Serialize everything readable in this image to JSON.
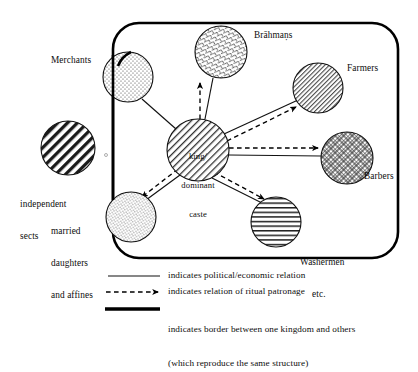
{
  "figure": {
    "title_visible": false,
    "colors": {
      "ink": "#111111",
      "background": "#ffffff",
      "border": "#000000"
    }
  },
  "nodes": [
    {
      "id": "independent-sects",
      "label": "independent\nsects",
      "label_line1": "independent",
      "label_line2": "sects",
      "pattern": "bold-diagonal-hatch",
      "inside_kingdom": false,
      "cx": 68,
      "cy": 148,
      "r": 27
    },
    {
      "id": "merchants",
      "label": "Merchants",
      "pattern": "stipple-dots",
      "inside_kingdom": "straddles-border",
      "cx": 128,
      "cy": 77,
      "r": 25
    },
    {
      "id": "brahmans",
      "label": "Brāhmaṇs",
      "pattern": "fine-crosshatch-zigzag",
      "inside_kingdom": true,
      "cx": 221,
      "cy": 52,
      "r": 26
    },
    {
      "id": "farmers",
      "label": "Farmers",
      "pattern": "fine-diagonal-hatch",
      "inside_kingdom": true,
      "cx": 318,
      "cy": 88,
      "r": 25
    },
    {
      "id": "king-dominant-caste",
      "label": "king/\ndominant\ncaste",
      "label_line1": "king/",
      "label_line2": "dominant",
      "label_line3": "caste",
      "pattern": "diagonal-hatch",
      "inside_kingdom": true,
      "cx": 198,
      "cy": 150,
      "r": 31
    },
    {
      "id": "barbers",
      "label": "Barbers",
      "pattern": "diagonal-crosshatch",
      "inside_kingdom": true,
      "cx": 347,
      "cy": 158,
      "r": 26
    },
    {
      "id": "married-daughters-and-affines",
      "label": "married\ndaughters\nand affines",
      "label_line1": "married",
      "label_line2": "daughters",
      "label_line3": "and affines",
      "pattern": "fine-stipple",
      "inside_kingdom": "straddles-border",
      "cx": 131,
      "cy": 217,
      "r": 25
    },
    {
      "id": "washermen-etc",
      "label": "Washermen\netc.",
      "label_line1": "Washermen",
      "label_line2": "etc.",
      "pattern": "horizontal-lines",
      "inside_kingdom": true,
      "cx": 276,
      "cy": 222,
      "r": 25
    }
  ],
  "edges": [
    {
      "from": "king-dominant-caste",
      "to": "merchants",
      "kinds": [
        "political-economic"
      ]
    },
    {
      "from": "king-dominant-caste",
      "to": "brahmans",
      "kinds": [
        "political-economic",
        "ritual-patronage"
      ]
    },
    {
      "from": "king-dominant-caste",
      "to": "farmers",
      "kinds": [
        "political-economic",
        "ritual-patronage"
      ]
    },
    {
      "from": "king-dominant-caste",
      "to": "barbers",
      "kinds": [
        "political-economic",
        "ritual-patronage"
      ]
    },
    {
      "from": "king-dominant-caste",
      "to": "married-daughters-and-affines",
      "kinds": [
        "political-economic",
        "ritual-patronage"
      ]
    },
    {
      "from": "king-dominant-caste",
      "to": "washermen-etc",
      "kinds": [
        "political-economic",
        "ritual-patronage"
      ]
    }
  ],
  "kingdom_border": {
    "shape": "rounded-rectangle",
    "x": 113,
    "y": 23,
    "width": 285,
    "height": 235,
    "radius": 26
  },
  "legend": {
    "items": [
      {
        "key": "solid-line",
        "swatch": "thin-solid-line",
        "text": "indicates political/economic relation"
      },
      {
        "key": "dashed-arrow",
        "swatch": "dashed-line-with-arrowhead",
        "text": "indicates relation of ritual patronage"
      },
      {
        "key": "thick-line",
        "swatch": "thick-solid-line",
        "text_line1": "indicates border between one kingdom and others",
        "text_line2": "(which reproduce the same structure)"
      }
    ]
  }
}
